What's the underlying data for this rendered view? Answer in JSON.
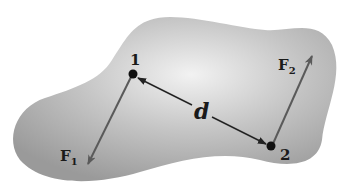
{
  "diagram": {
    "points": [
      {
        "id": "1",
        "label": "1"
      },
      {
        "id": "2",
        "label": "2"
      }
    ],
    "forces": [
      {
        "label": "F",
        "subscript": "1"
      },
      {
        "label": "F",
        "subscript": "2"
      }
    ],
    "distance_label": "d",
    "colors": {
      "body_fill": "#a8a8a8",
      "arrow": "#5a5a5a",
      "point": "#111111",
      "text": "#1a1a1a"
    }
  }
}
